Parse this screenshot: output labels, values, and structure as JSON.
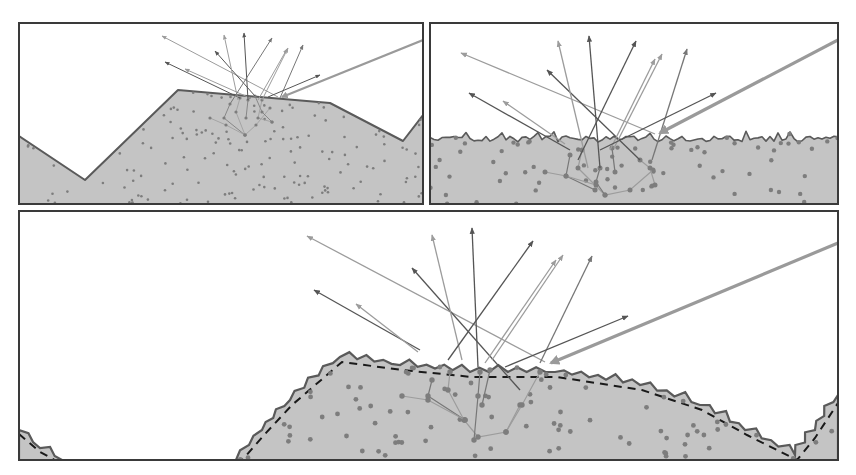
{
  "canvas": {
    "width": 856,
    "height": 475,
    "background": "#ffffff"
  },
  "colors": {
    "frame": "#3a3a3a",
    "material_fill": "#c4c4c4",
    "surface_stroke": "#5a5a5a",
    "particle": "#7d7d7d",
    "incident": "#9a9a9a",
    "dashed_macro": "#1a1a1a",
    "ray_dark": "#555555",
    "ray_mid": "#777777",
    "ray_light": "#9c9c9c"
  },
  "panels": [
    {
      "id": "macro",
      "label": "macro-surface-panel",
      "frame": {
        "x": 19,
        "y": 23,
        "w": 404,
        "h": 181
      },
      "surface": [
        [
          19,
          136
        ],
        [
          85,
          180
        ],
        [
          178,
          90
        ],
        [
          330,
          103
        ],
        [
          403,
          141
        ],
        [
          423,
          115
        ],
        [
          423,
          204
        ],
        [
          19,
          204
        ]
      ],
      "incident": {
        "from": [
          423,
          40
        ],
        "to": [
          282,
          97
        ]
      },
      "rays": [
        {
          "from": [
            278,
            97
          ],
          "to": [
            162,
            36
          ],
          "tone": "ray_light"
        },
        {
          "from": [
            240,
            98
          ],
          "to": [
            165,
            62
          ],
          "tone": "ray_dark"
        },
        {
          "from": [
            250,
            98
          ],
          "to": [
            185,
            69
          ],
          "tone": "ray_light"
        },
        {
          "from": [
            255,
            96
          ],
          "to": [
            215,
            51
          ],
          "tone": "ray_dark"
        },
        {
          "from": [
            238,
            100
          ],
          "to": [
            224,
            35
          ],
          "tone": "ray_light"
        },
        {
          "from": [
            248,
            100
          ],
          "to": [
            244,
            33
          ],
          "tone": "ray_dark"
        },
        {
          "from": [
            230,
            104
          ],
          "to": [
            272,
            38
          ],
          "tone": "ray_mid"
        },
        {
          "from": [
            258,
            100
          ],
          "to": [
            287,
            49
          ],
          "tone": "ray_light"
        },
        {
          "from": [
            262,
            100
          ],
          "to": [
            288,
            48
          ],
          "tone": "ray_light"
        },
        {
          "from": [
            280,
            98
          ],
          "to": [
            303,
            45
          ],
          "tone": "ray_mid"
        },
        {
          "from": [
            268,
            97
          ],
          "to": [
            320,
            75
          ],
          "tone": "ray_dark"
        }
      ],
      "subsurface": [
        [
          [
            230,
            104
          ],
          [
            224,
            118
          ],
          [
            245,
            135
          ]
        ],
        [
          [
            240,
            98
          ],
          [
            236,
            112
          ],
          [
            245,
            135
          ],
          [
            256,
            125
          ],
          [
            270,
            108
          ]
        ],
        [
          [
            255,
            96
          ],
          [
            262,
            112
          ],
          [
            272,
            122
          ]
        ],
        [
          [
            210,
            118
          ],
          [
            226,
            125
          ],
          [
            245,
            135
          ]
        ],
        [
          [
            248,
            100
          ],
          [
            246,
            118
          ]
        ],
        [
          [
            262,
            100
          ],
          [
            258,
            118
          ],
          [
            272,
            122
          ]
        ]
      ],
      "seed": 11,
      "particle_count": 150,
      "particle_r": 1.3
    },
    {
      "id": "micro",
      "label": "micro-surface-panel",
      "frame": {
        "x": 430,
        "y": 23,
        "w": 408,
        "h": 181
      },
      "surface_base_y": 139,
      "surface_jag": 3,
      "incident": {
        "from": [
          838,
          40
        ],
        "to": [
          660,
          133
        ]
      },
      "rays": [
        {
          "from": [
            655,
            134
          ],
          "to": [
            461,
            53
          ],
          "tone": "ray_light"
        },
        {
          "from": [
            570,
            150
          ],
          "to": [
            469,
            93
          ],
          "tone": "ray_dark"
        },
        {
          "from": [
            565,
            144
          ],
          "to": [
            503,
            101
          ],
          "tone": "ray_light"
        },
        {
          "from": [
            640,
            160
          ],
          "to": [
            547,
            70
          ],
          "tone": "ray_dark"
        },
        {
          "from": [
            588,
            168
          ],
          "to": [
            558,
            41
          ],
          "tone": "ray_light"
        },
        {
          "from": [
            600,
            168
          ],
          "to": [
            589,
            36
          ],
          "tone": "ray_dark"
        },
        {
          "from": [
            578,
            160
          ],
          "to": [
            636,
            41
          ],
          "tone": "ray_dark"
        },
        {
          "from": [
            610,
            150
          ],
          "to": [
            655,
            59
          ],
          "tone": "ray_light"
        },
        {
          "from": [
            614,
            148
          ],
          "to": [
            662,
            54
          ],
          "tone": "ray_light"
        },
        {
          "from": [
            652,
            160
          ],
          "to": [
            687,
            49
          ],
          "tone": "ray_mid"
        },
        {
          "from": [
            600,
            150
          ],
          "to": [
            716,
            93
          ],
          "tone": "ray_dark"
        }
      ],
      "subsurface": [
        [
          [
            570,
            155
          ],
          [
            566,
            176
          ],
          [
            595,
            190
          ]
        ],
        [
          [
            582,
            150
          ],
          [
            578,
            168
          ],
          [
            605,
            195
          ],
          [
            630,
            190
          ],
          [
            653,
            170
          ]
        ],
        [
          [
            600,
            168
          ],
          [
            596,
            182
          ],
          [
            605,
            195
          ]
        ],
        [
          [
            545,
            172
          ],
          [
            566,
            176
          ],
          [
            596,
            185
          ]
        ],
        [
          [
            612,
            148
          ],
          [
            615,
            172
          ]
        ],
        [
          [
            640,
            160
          ],
          [
            650,
            168
          ],
          [
            655,
            185
          ]
        ]
      ],
      "seed": 23,
      "particle_count": 70,
      "particle_r": 2.2
    },
    {
      "id": "mixed",
      "label": "macro-micro-surface-panel",
      "frame": {
        "x": 19,
        "y": 211,
        "w": 819,
        "h": 249
      },
      "macro_curve": [
        [
          19,
          430
        ],
        [
          40,
          450
        ],
        [
          60,
          460
        ],
        [
          240,
          460
        ],
        [
          290,
          400
        ],
        [
          340,
          357
        ],
        [
          400,
          365
        ],
        [
          470,
          372
        ],
        [
          555,
          372
        ],
        [
          640,
          385
        ],
        [
          700,
          405
        ],
        [
          745,
          430
        ],
        [
          795,
          452
        ],
        [
          815,
          430
        ],
        [
          838,
          400
        ],
        [
          838,
          460
        ],
        [
          19,
          460
        ]
      ],
      "jag": 5,
      "incident": {
        "from": [
          838,
          243
        ],
        "to": [
          551,
          363
        ]
      },
      "rays": [
        {
          "from": [
            545,
            362
          ],
          "to": [
            307,
            236
          ],
          "tone": "ray_light"
        },
        {
          "from": [
            420,
            350
          ],
          "to": [
            314,
            290
          ],
          "tone": "ray_dark"
        },
        {
          "from": [
            418,
            352
          ],
          "to": [
            356,
            304
          ],
          "tone": "ray_light"
        },
        {
          "from": [
            520,
            390
          ],
          "to": [
            412,
            268
          ],
          "tone": "ray_dark"
        },
        {
          "from": [
            462,
            360
          ],
          "to": [
            432,
            235
          ],
          "tone": "ray_light"
        },
        {
          "from": [
            478,
            367
          ],
          "to": [
            472,
            228
          ],
          "tone": "ray_dark"
        },
        {
          "from": [
            448,
            360
          ],
          "to": [
            533,
            241
          ],
          "tone": "ray_dark"
        },
        {
          "from": [
            485,
            363
          ],
          "to": [
            556,
            260
          ],
          "tone": "ray_light"
        },
        {
          "from": [
            492,
            360
          ],
          "to": [
            563,
            255
          ],
          "tone": "ray_light"
        },
        {
          "from": [
            540,
            363
          ],
          "to": [
            592,
            256
          ],
          "tone": "ray_mid"
        },
        {
          "from": [
            505,
            367
          ],
          "to": [
            628,
            316
          ],
          "tone": "ray_dark"
        }
      ],
      "subsurface": [
        [
          [
            432,
            380
          ],
          [
            428,
            396
          ],
          [
            465,
            420
          ]
        ],
        [
          [
            450,
            372
          ],
          [
            448,
            390
          ],
          [
            464,
            420
          ],
          [
            478,
            437
          ],
          [
            506,
            432
          ],
          [
            520,
            405
          ]
        ],
        [
          [
            480,
            372
          ],
          [
            478,
            396
          ],
          [
            474,
            440
          ]
        ],
        [
          [
            402,
            396
          ],
          [
            428,
            400
          ],
          [
            465,
            420
          ]
        ],
        [
          [
            490,
            370
          ],
          [
            482,
            405
          ]
        ],
        [
          [
            540,
            372
          ],
          [
            522,
            405
          ],
          [
            506,
            432
          ]
        ]
      ],
      "seed": 37,
      "particle_count": 85,
      "particle_r": 2.4
    }
  ]
}
